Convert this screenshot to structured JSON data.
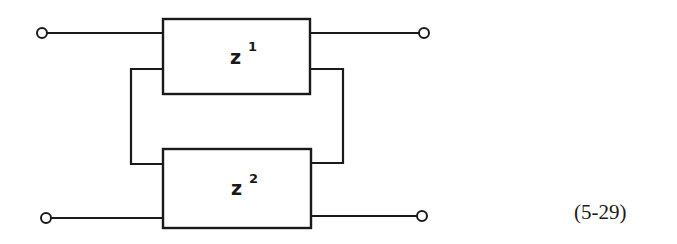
{
  "diagram": {
    "blocks": [
      {
        "id": "z1",
        "label": "z",
        "superscript": "1"
      },
      {
        "id": "z2",
        "label": "z",
        "superscript": "2"
      }
    ],
    "terminals": [
      "input-top",
      "input-bottom",
      "output-top",
      "output-bottom"
    ],
    "equation_number": "(5-29)"
  }
}
